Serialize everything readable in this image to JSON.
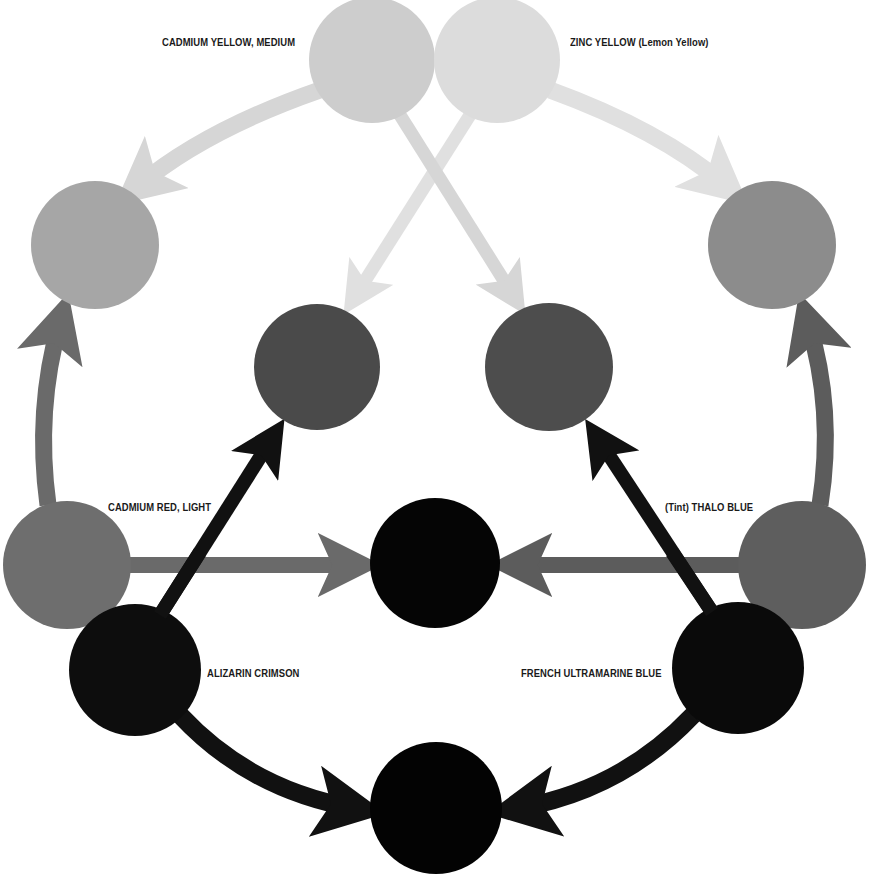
{
  "diagram": {
    "type": "color-mixing-wheel",
    "labels": {
      "cadmium_yellow_medium": "CADMIUM YELLOW, MEDIUM",
      "zinc_yellow": "ZINC YELLOW (Lemon Yellow)",
      "cadmium_red_light": "CADMIUM RED, LIGHT",
      "thalo_blue": "(Tint) THALO BLUE",
      "alizarin_crimson": "ALIZARIN CRIMSON",
      "french_ultramarine_blue": "FRENCH ULTRAMARINE BLUE"
    },
    "nodes": [
      {
        "id": "cadmium-yellow-medium",
        "cx": 372,
        "cy": 60,
        "r": 63,
        "fill": "#cdcdcd",
        "label_key": "cadmium_yellow_medium"
      },
      {
        "id": "zinc-yellow",
        "cx": 497,
        "cy": 60,
        "r": 63,
        "fill": "#dcdcdc",
        "label_key": "zinc_yellow"
      },
      {
        "id": "mix-orange",
        "cx": 95,
        "cy": 245,
        "r": 64,
        "fill": "#a6a6a6"
      },
      {
        "id": "mix-green-light",
        "cx": 772,
        "cy": 245,
        "r": 64,
        "fill": "#8c8c8c"
      },
      {
        "id": "mix-violet-left",
        "cx": 317,
        "cy": 367,
        "r": 63,
        "fill": "#4a4a4a"
      },
      {
        "id": "mix-green-right",
        "cx": 549,
        "cy": 367,
        "r": 64,
        "fill": "#4d4d4d"
      },
      {
        "id": "cadmium-red-light",
        "cx": 67,
        "cy": 565,
        "r": 64,
        "fill": "#6e6e6e",
        "label_key": "cadmium_red_light"
      },
      {
        "id": "mix-center-dark",
        "cx": 435,
        "cy": 563,
        "r": 65,
        "fill": "#050505"
      },
      {
        "id": "thalo-blue",
        "cx": 802,
        "cy": 565,
        "r": 64,
        "fill": "#5e5e5e",
        "label_key": "thalo_blue"
      },
      {
        "id": "alizarin-crimson",
        "cx": 135,
        "cy": 670,
        "r": 66,
        "fill": "#0d0d0d",
        "label_key": "alizarin_crimson"
      },
      {
        "id": "french-ultramarine-blue",
        "cx": 738,
        "cy": 668,
        "r": 66,
        "fill": "#0a0a0a",
        "label_key": "french_ultramarine_blue"
      },
      {
        "id": "mix-bottom-dark",
        "cx": 436,
        "cy": 808,
        "r": 66,
        "fill": "#030303"
      }
    ],
    "edges": [
      {
        "from": "cadmium-yellow-medium",
        "to": "mix-orange"
      },
      {
        "from": "cadmium-yellow-medium",
        "to": "mix-green-right"
      },
      {
        "from": "zinc-yellow",
        "to": "mix-green-light"
      },
      {
        "from": "zinc-yellow",
        "to": "mix-violet-left"
      },
      {
        "from": "cadmium-red-light",
        "to": "mix-orange"
      },
      {
        "from": "cadmium-red-light",
        "to": "mix-center-dark"
      },
      {
        "from": "thalo-blue",
        "to": "mix-green-light"
      },
      {
        "from": "thalo-blue",
        "to": "mix-center-dark"
      },
      {
        "from": "alizarin-crimson",
        "to": "mix-violet-left"
      },
      {
        "from": "alizarin-crimson",
        "to": "mix-bottom-dark"
      },
      {
        "from": "french-ultramarine-blue",
        "to": "mix-green-right"
      },
      {
        "from": "french-ultramarine-blue",
        "to": "mix-bottom-dark"
      }
    ],
    "colors": {
      "yellow_arrow": "#d6d6d6",
      "zinc_arrow": "#e0e0e0",
      "red_arrow": "#6a6a6a",
      "blue_arrow": "#5c5c5c",
      "dark_arrow": "#111111",
      "label_text": "#1a1a1a",
      "background": "#ffffff"
    }
  }
}
